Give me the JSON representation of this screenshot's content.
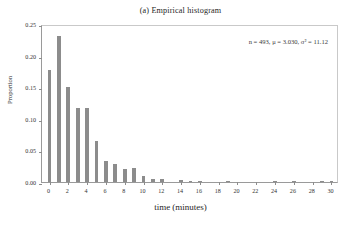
{
  "figure": {
    "title": "(a) Empirical histogram",
    "annotation": "n = 493, μ = 3.030, σ² = 11.12"
  },
  "chart_data": {
    "type": "bar",
    "title": "(a) Empirical histogram",
    "xlabel": "time (minutes)",
    "ylabel": "Proportion",
    "xlim": [
      -0.8,
      30.8
    ],
    "ylim": [
      0.0,
      0.25
    ],
    "grid": false,
    "legend": null,
    "bar_color": "#8c8c8c",
    "annotations": [
      {
        "text": "n = 493, μ = 3.030, σ² = 11.12",
        "n": 493,
        "mean": 3.03,
        "variance": 11.12
      }
    ],
    "xticks": [
      0,
      2,
      4,
      6,
      8,
      10,
      12,
      14,
      16,
      18,
      20,
      22,
      24,
      26,
      28,
      30
    ],
    "xtick_labels": [
      "0",
      "2",
      "4",
      "6",
      "8",
      "10",
      "12",
      "14",
      "16",
      "18",
      "20",
      "22",
      "24",
      "26",
      "28",
      "30"
    ],
    "yticks": [
      0.0,
      0.05,
      0.1,
      0.15,
      0.2,
      0.25
    ],
    "ytick_labels": [
      "0.00",
      "0.05",
      "0.10",
      "0.15",
      "0.20",
      "0.25"
    ],
    "categories": [
      0,
      1,
      2,
      3,
      4,
      5,
      6,
      7,
      8,
      9,
      10,
      11,
      12,
      13,
      14,
      15,
      16,
      17,
      18,
      19,
      20,
      21,
      22,
      23,
      24,
      25,
      26,
      27,
      28,
      29,
      30
    ],
    "values": [
      0.177,
      0.231,
      0.15,
      0.117,
      0.117,
      0.065,
      0.034,
      0.028,
      0.02,
      0.022,
      0.01,
      0.004,
      0.005,
      0.0,
      0.003,
      0.002,
      0.002,
      0.0,
      0.0,
      0.002,
      0.0,
      0.0,
      0.0,
      0.0,
      0.002,
      0.0,
      0.002,
      0.0,
      0.0,
      0.002,
      0.002
    ]
  }
}
